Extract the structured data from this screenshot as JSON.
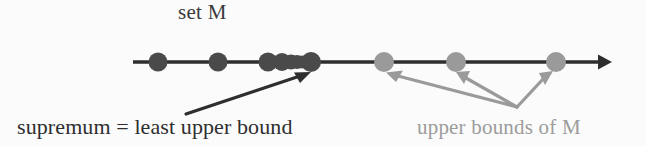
{
  "figure": {
    "background_color": "#fbfbfb"
  },
  "labels": {
    "set_m": "set M",
    "supremum": "supremum = least upper bound",
    "upper_bounds": "upper bounds of M"
  },
  "colors": {
    "dark": "#4a4a4a",
    "axis": "#2e2e2e",
    "gray": "#9a9a9a",
    "gray_text": "#9c9c9c",
    "dark_text": "#2e2e2e",
    "set_m_text": "#3a3a3a"
  },
  "chart_data": {
    "type": "scatter",
    "xlabel": "",
    "ylabel": "",
    "axis": {
      "orientation": "horizontal",
      "y_pixel": 62,
      "x_start": 133,
      "x_end": 612,
      "arrowhead": "right",
      "line_width": 3
    },
    "series": [
      {
        "name": "set M (elements)",
        "color": "#4a4a4a",
        "points": [
          {
            "x": 158,
            "r": 9.5
          },
          {
            "x": 218,
            "r": 9.5
          },
          {
            "x": 268,
            "r": 9.5
          },
          {
            "x": 282,
            "r": 9.0
          },
          {
            "x": 291,
            "r": 7.5
          },
          {
            "x": 297,
            "r": 7.0
          },
          {
            "x": 302,
            "r": 6.5
          },
          {
            "x": 311,
            "r": 10.0
          }
        ]
      },
      {
        "name": "upper bounds of M",
        "color": "#9a9a9a",
        "points": [
          {
            "x": 384,
            "r": 10.0
          },
          {
            "x": 456,
            "r": 10.0
          },
          {
            "x": 556,
            "r": 10.0
          }
        ]
      }
    ],
    "annotations": [
      {
        "name": "supremum-arrow",
        "text": "supremum = least upper bound",
        "color": "#2e2e2e",
        "from": [
          186,
          114
        ],
        "to": [
          308,
          73
        ]
      },
      {
        "name": "upper-bound-arrow-1",
        "text": "upper bounds of M",
        "color": "#9a9a9a",
        "from": [
          517,
          107
        ],
        "to": [
          386,
          72
        ]
      },
      {
        "name": "upper-bound-arrow-2",
        "text": "upper bounds of M",
        "color": "#9a9a9a",
        "from": [
          517,
          107
        ],
        "to": [
          458,
          72
        ]
      },
      {
        "name": "upper-bound-arrow-3",
        "text": "upper bounds of M",
        "color": "#9a9a9a",
        "from": [
          517,
          107
        ],
        "to": [
          553,
          72
        ]
      }
    ],
    "legend": {
      "position": "none"
    },
    "grid": false
  }
}
